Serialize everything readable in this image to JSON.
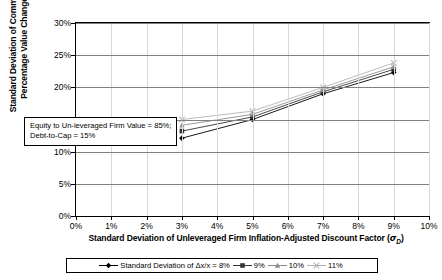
{
  "chart_data": {
    "type": "line",
    "title": "",
    "xlabel": "Standard Deviation of Unleveraged Firm Inflation-Adjusted Discount Factor (σD)",
    "ylabel": "Standard Deviation of Common Equity Percentage Value Changes (σE)",
    "x": [
      3,
      5,
      7,
      9
    ],
    "xlim": [
      0,
      10
    ],
    "ylim": [
      0,
      30
    ],
    "xticks": [
      "0%",
      "1%",
      "2%",
      "3%",
      "4%",
      "5%",
      "6%",
      "7%",
      "8%",
      "9%",
      "10%"
    ],
    "yticks": [
      "0%",
      "5%",
      "10%",
      "15%",
      "20%",
      "25%",
      "30%"
    ],
    "grid": "horizontal",
    "legend_position": "bottom",
    "series": [
      {
        "name": "Standard Deviation of Δx/x = 8%",
        "label": "8%",
        "marker": "diamond",
        "color": "#000000",
        "values": [
          12.1,
          15.0,
          19.0,
          22.3
        ]
      },
      {
        "name": "9%",
        "label": "9%",
        "marker": "square",
        "color": "#333333",
        "values": [
          13.2,
          15.4,
          19.3,
          22.8
        ]
      },
      {
        "name": "10%",
        "label": "10%",
        "marker": "triangle",
        "color": "#8c8c8c",
        "values": [
          14.1,
          15.8,
          19.6,
          23.2
        ]
      },
      {
        "name": "11%",
        "label": "11%",
        "marker": "cross",
        "color": "#b3b3b3",
        "values": [
          15.0,
          16.3,
          20.0,
          23.8
        ]
      }
    ]
  },
  "annotation": {
    "line1": "Equity to Un-leveraged Firm Value = 85%;",
    "line2": "Debt-to-Cap = 15%"
  },
  "legend": {
    "prefix": "Standard Deviation of Δx/x = "
  },
  "axis_titles": {
    "x_prefix": "Standard Deviation of Unleveraged Firm Inflation-Adjusted Discount Factor (",
    "x_symbol": "σ",
    "x_subscript": "D",
    "x_suffix": ")",
    "y_line1": "Standard Deviation of Common Equity",
    "y_prefix": "Percentage Value Changes (",
    "y_symbol": "σ",
    "y_subscript": "E",
    "y_suffix": ")"
  }
}
